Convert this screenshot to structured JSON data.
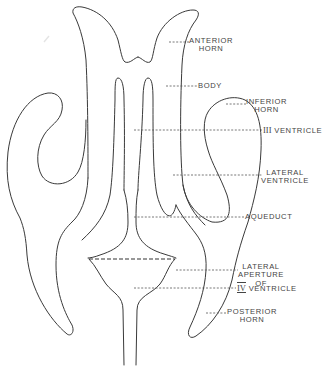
{
  "figure": {
    "line_color": "#3a3a3a",
    "label_color": "#444444",
    "background": "#ffffff"
  },
  "labels": [
    {
      "id": "anterior-horn",
      "lines": [
        "ANTERIOR",
        "HORN"
      ]
    },
    {
      "id": "body",
      "lines": [
        "BODY"
      ]
    },
    {
      "id": "inferior-horn",
      "lines": [
        "INFERIOR",
        "HORN"
      ]
    },
    {
      "id": "third-ventricle",
      "lines": [
        "III VENTRICLE"
      ]
    },
    {
      "id": "lateral-ventricle",
      "lines": [
        "LATERAL",
        "VENTRICLE"
      ]
    },
    {
      "id": "aqueduct",
      "lines": [
        "AQUEDUCT"
      ]
    },
    {
      "id": "lateral-aperture",
      "lines": [
        "LATERAL",
        "APERTURE",
        "OF"
      ]
    },
    {
      "id": "fourth-ventricle",
      "lines": [
        "IV VENTRICLE"
      ]
    },
    {
      "id": "posterior-horn",
      "lines": [
        "POSTERIOR",
        "HORN"
      ]
    }
  ],
  "text": {
    "anterior_horn_1": "ANTERIOR",
    "anterior_horn_2": "HORN",
    "body": "BODY",
    "inferior_horn_1": "INFERIOR",
    "inferior_horn_2": "HORN",
    "third_ventricle_numeral": "III",
    "third_ventricle": "VENTRICLE",
    "lateral_ventricle_1": "LATERAL",
    "lateral_ventricle_2": "VENTRICLE",
    "aqueduct": "AQUEDUCT",
    "lateral_aperture_1": "LATERAL",
    "lateral_aperture_2": "APERTURE",
    "lateral_aperture_3": "OF",
    "fourth_ventricle_numeral": "IV",
    "fourth_ventricle": "VENTRICLE",
    "posterior_horn_1": "POSTERIOR",
    "posterior_horn_2": "HORN"
  }
}
